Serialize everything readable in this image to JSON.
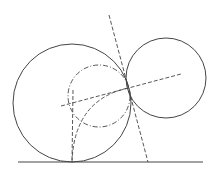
{
  "diagram": {
    "width": 220,
    "height": 180,
    "stroke_color": "#444444",
    "background": "#ffffff",
    "ground_line": {
      "x1": 18,
      "y1": 162,
      "x2": 203,
      "y2": 162
    },
    "circles": [
      {
        "name": "large-left-circle",
        "cx": 72,
        "cy": 103,
        "r": 59,
        "style": "solid"
      },
      {
        "name": "right-circle",
        "cx": 166,
        "cy": 78,
        "r": 40,
        "style": "solid"
      },
      {
        "name": "dash-dot-circle",
        "cx": 99,
        "cy": 96,
        "r": 31,
        "style": "dash-dot"
      }
    ],
    "dashed_lines": [
      {
        "name": "tangent-line",
        "x1": 109,
        "y1": 15,
        "x2": 148,
        "y2": 162
      },
      {
        "name": "center-line",
        "x1": 61,
        "y1": 106,
        "x2": 181,
        "y2": 74
      },
      {
        "name": "vertical-line",
        "x1": 73,
        "y1": 90,
        "x2": 72,
        "y2": 162
      }
    ],
    "dashed_arcs": [
      {
        "name": "quarter-arc",
        "d": "M 72 162 Q 74 100 128 88"
      }
    ]
  }
}
